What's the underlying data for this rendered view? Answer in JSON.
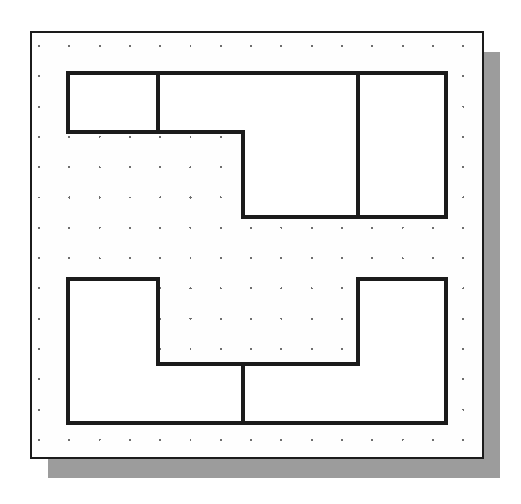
{
  "canvas": {
    "width": 521,
    "height": 504,
    "background_color": "#ffffff",
    "label": "sketch-drawing-canvas"
  },
  "panel": {
    "label": "Drawing Sheet",
    "x": 31,
    "y": 32,
    "width": 452,
    "height": 426,
    "fill_color": "#fefefe",
    "border_color": "#1b1b1b",
    "border_width": 2
  },
  "shadow": {
    "label": "panel-drop-shadow",
    "offset_x": 17,
    "offset_y": 20,
    "color": "#9c9c9c"
  },
  "grid": {
    "label": "snap-dot-grid",
    "origin_x": 39,
    "origin_y": 46,
    "spacing": 30.3,
    "columns": 15,
    "rows": 14,
    "dot_radius": 1.1,
    "dot_color": "#6e6e6e",
    "visible": true
  },
  "geometry": {
    "line_color": "#1b1b1b",
    "line_width": 4,
    "fill_color": "#ffffff",
    "profiles": [
      {
        "name": "upper-profile",
        "label": "Upper Z Profile",
        "type": "closed-polyline",
        "vertices": [
          [
            68,
            73
          ],
          [
            446,
            73
          ],
          [
            446,
            217
          ],
          [
            243,
            217
          ],
          [
            243,
            132
          ],
          [
            68,
            132
          ]
        ],
        "segment_count": 6
      },
      {
        "name": "lower-profile",
        "label": "Lower U Profile",
        "type": "closed-polyline",
        "vertices": [
          [
            68,
            279
          ],
          [
            158,
            279
          ],
          [
            158,
            364
          ],
          [
            358,
            364
          ],
          [
            358,
            279
          ],
          [
            446,
            279
          ],
          [
            446,
            423
          ],
          [
            68,
            423
          ]
        ],
        "segment_count": 8
      }
    ],
    "dividers": [
      {
        "name": "upper-left-divider",
        "label": "Upper Left Divider",
        "x1": 158,
        "y1": 73,
        "x2": 158,
        "y2": 132
      },
      {
        "name": "upper-right-divider",
        "label": "Upper Right Divider",
        "x1": 358,
        "y1": 73,
        "x2": 358,
        "y2": 217
      },
      {
        "name": "lower-center-divider",
        "label": "Lower Center Divider",
        "x1": 243,
        "y1": 364,
        "x2": 243,
        "y2": 423
      }
    ]
  }
}
